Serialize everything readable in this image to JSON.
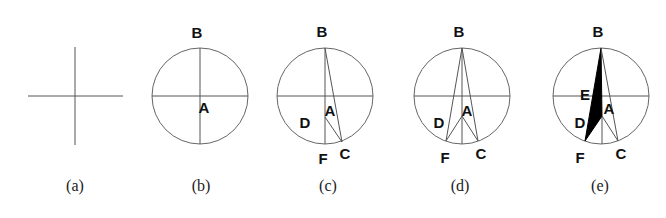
{
  "figure": {
    "panels": [
      {
        "id": "a",
        "caption": "(a)",
        "labels": {}
      },
      {
        "id": "b",
        "caption": "(b)",
        "labels": {
          "B": "B",
          "A": "A"
        }
      },
      {
        "id": "c",
        "caption": "(c)",
        "labels": {
          "B": "B",
          "A": "A",
          "D": "D",
          "F": "F",
          "C": "C"
        }
      },
      {
        "id": "d",
        "caption": "(d)",
        "labels": {
          "B": "B",
          "A": "A",
          "D": "D",
          "F": "F",
          "C": "C"
        }
      },
      {
        "id": "e",
        "caption": "(e)",
        "labels": {
          "B": "B",
          "E": "E",
          "A": "A",
          "D": "D",
          "F": "F",
          "C": "C"
        }
      }
    ],
    "colors": {
      "line": "#555555",
      "fill": "#000000",
      "background": "#ffffff"
    }
  }
}
